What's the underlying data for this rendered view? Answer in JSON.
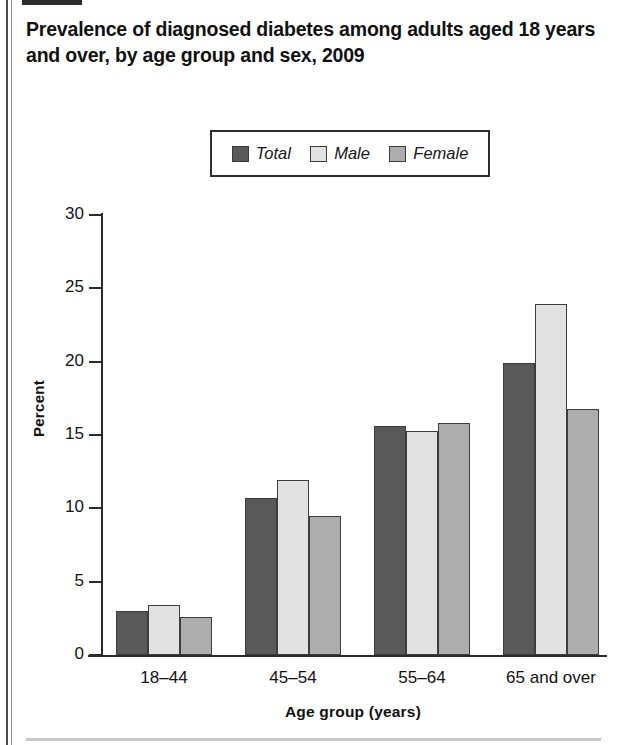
{
  "chart_data": {
    "type": "bar",
    "title": "Prevalence of diagnosed diabetes among adults aged 18 years and over, by age group and sex, 2009",
    "xlabel": "Age group (years)",
    "ylabel": "Percent",
    "categories": [
      "18–44",
      "45–54",
      "55–64",
      "65 and over"
    ],
    "series": [
      {
        "name": "Total",
        "color": "#595959",
        "values": [
          3.0,
          10.7,
          15.6,
          19.9
        ]
      },
      {
        "name": "Male",
        "color": "#e2e2e2",
        "values": [
          3.4,
          11.9,
          15.3,
          23.9
        ]
      },
      {
        "name": "Female",
        "color": "#adadad",
        "values": [
          2.6,
          9.5,
          15.8,
          16.8
        ]
      }
    ],
    "ylim": [
      0,
      30
    ],
    "yticks": [
      0,
      5,
      10,
      15,
      20,
      25,
      30
    ],
    "ytick_labels": [
      "0",
      "5",
      "10",
      "15",
      "20",
      "25",
      "30"
    ],
    "grid": false,
    "legend_position": "top-center"
  },
  "legend": {
    "items": [
      {
        "label": "Total",
        "swatch": "legend-swatch-total"
      },
      {
        "label": "Male",
        "swatch": "legend-swatch-male"
      },
      {
        "label": "Female",
        "swatch": "legend-swatch-female"
      }
    ]
  }
}
